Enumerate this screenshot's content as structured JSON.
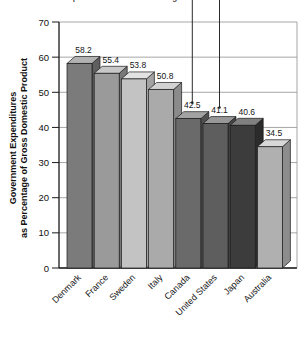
{
  "chart_data": {
    "type": "bar",
    "title": "Government Expenditures as a Percentage of Gross Domestic Product",
    "xlabel": "",
    "ylabel": "Government Expenditures\nas Percentage of Gross Domestic Product",
    "ylabel_line1": "Government Expenditures",
    "ylabel_line2": "as Percentage of Gross Domestic Product",
    "categories": [
      "Denmark",
      "France",
      "Sweden",
      "Italy",
      "Canada",
      "United States",
      "Japan",
      "Australia"
    ],
    "values": [
      58.2,
      55.4,
      53.8,
      50.8,
      42.5,
      41.1,
      40.6,
      34.5
    ],
    "value_labels": [
      "58.2",
      "55.4",
      "53.8",
      "50.8",
      "42.5",
      "41.1",
      "40.6",
      "34.5"
    ],
    "ylim": [
      0,
      70
    ],
    "yticks": [
      0,
      10,
      20,
      30,
      40,
      50,
      60,
      70
    ],
    "ytick_labels": [
      "0",
      "10",
      "20",
      "30",
      "40",
      "50",
      "60",
      "70"
    ],
    "grid": true,
    "legend": null,
    "style": "3d-bar",
    "bar_colors": [
      "#7b7b7b",
      "#9a9a9a",
      "#c3c3c3",
      "#aaaaaa",
      "#6a6a6a",
      "#5e5e5e",
      "#3c3c3c",
      "#b0b0b0"
    ],
    "bar_top_colors": [
      "#b2b2b2",
      "#c8c8c8",
      "#e2e2e2",
      "#d2d2d2",
      "#a2a2a2",
      "#989898",
      "#808080",
      "#d8d8d8"
    ],
    "bar_side_colors": [
      "#5f5f5f",
      "#787878",
      "#a2a2a2",
      "#8b8b8b",
      "#505050",
      "#464646",
      "#2b2b2b",
      "#8d8d8d"
    ],
    "annotations": [
      {
        "name": "leader-line-canada",
        "target": "Canada",
        "label": "42.5"
      },
      {
        "name": "leader-line-united-states",
        "target": "United States",
        "label": "41.1"
      }
    ],
    "axis_color": "#1a1a1a",
    "grid_color": "#8f8f8f",
    "background": "#ffffff"
  }
}
